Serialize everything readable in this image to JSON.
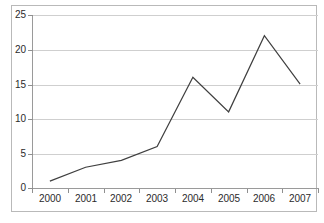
{
  "chart_data": {
    "type": "line",
    "title": "",
    "subtitle": "",
    "xlabel": "",
    "ylabel": "",
    "categories": [
      "2000",
      "2001",
      "2002",
      "2003",
      "2004",
      "2005",
      "2006",
      "2007"
    ],
    "series": [
      {
        "name": "",
        "values": [
          1,
          3,
          4,
          6,
          16,
          11,
          22,
          15
        ]
      }
    ],
    "x": [
      "2000",
      "2001",
      "2002",
      "2003",
      "2004",
      "2005",
      "2006",
      "2007"
    ],
    "values": [
      1,
      3,
      4,
      6,
      16,
      11,
      22,
      15
    ],
    "ylim": [
      0,
      25
    ],
    "ytick_labels": [
      "0",
      "5",
      "10",
      "15",
      "20",
      "25"
    ],
    "ytick_values": [
      0,
      5,
      10,
      15,
      20,
      25
    ],
    "xtick_labels": [
      "2000",
      "2001",
      "2002",
      "2003",
      "2004",
      "2005",
      "2006",
      "2007"
    ],
    "grid": "horizontal",
    "legend": "none",
    "annotations": [],
    "colors": {
      "series_line": "#3f3f3f",
      "gridline": "#cfcfcf",
      "axis": "#9a9a9a",
      "frame": "#b9b9b9",
      "tick_label": "#2b2b2b",
      "background": "#ffffff"
    }
  }
}
